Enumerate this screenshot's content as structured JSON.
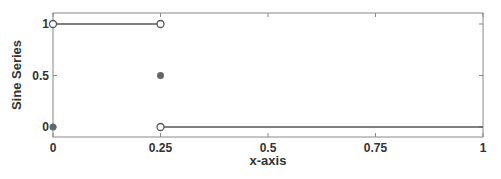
{
  "chart_data": {
    "type": "line",
    "title": "",
    "xlabel": "x-axis",
    "ylabel": "Sine Series",
    "xlim": [
      0,
      1
    ],
    "ylim": [
      -0.1,
      1.1
    ],
    "xticks": [
      0,
      0.25,
      0.5,
      0.75,
      1
    ],
    "xtick_labels": [
      "0",
      "0.25",
      "0.5",
      "0.75",
      "1"
    ],
    "yticks": [
      0,
      0.5,
      1
    ],
    "ytick_labels": [
      "0",
      "0.5",
      "1"
    ],
    "grid": false,
    "legend": null,
    "series": [
      {
        "name": "segment-high",
        "x": [
          0,
          0.25
        ],
        "y": [
          1,
          1
        ],
        "style": "line",
        "endpoints": "open-circle"
      },
      {
        "name": "segment-low",
        "x": [
          0.25,
          1
        ],
        "y": [
          0,
          0
        ],
        "style": "line",
        "start": "open-circle"
      },
      {
        "name": "filled-points",
        "x": [
          0,
          0.25
        ],
        "y": [
          0,
          0.5
        ],
        "style": "filled-circle"
      }
    ],
    "colors": {
      "line": "#555555",
      "marker_fill": "#666666",
      "axis": "#888888"
    }
  }
}
